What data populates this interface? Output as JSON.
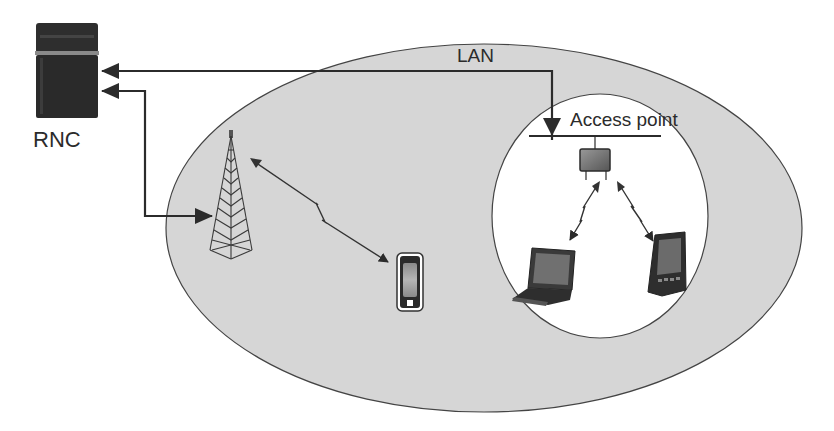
{
  "diagram": {
    "labels": {
      "rnc": "RNC",
      "lan": "LAN",
      "access_point": "Access point"
    },
    "nodes": [
      {
        "id": "rnc",
        "label": "RNC",
        "kind": "server"
      },
      {
        "id": "base-station",
        "label": "",
        "kind": "cell-tower"
      },
      {
        "id": "mobile-phone",
        "label": "",
        "kind": "phone"
      },
      {
        "id": "access-point",
        "label": "Access point",
        "kind": "wireless-access-point"
      },
      {
        "id": "laptop",
        "label": "",
        "kind": "laptop"
      },
      {
        "id": "pda",
        "label": "",
        "kind": "pda"
      }
    ],
    "regions": [
      {
        "id": "outer-coverage",
        "label": "",
        "fill": "#d6d6d6"
      },
      {
        "id": "wlan-coverage",
        "label": "",
        "fill": "#ffffff"
      }
    ],
    "edges": [
      {
        "from": "access-point",
        "to": "rnc",
        "label": "LAN",
        "type": "wired"
      },
      {
        "from": "base-station",
        "to": "rnc",
        "label": "",
        "type": "wired"
      },
      {
        "from": "base-station",
        "to": "mobile-phone",
        "label": "",
        "type": "wireless"
      },
      {
        "from": "access-point",
        "to": "laptop",
        "label": "",
        "type": "wireless"
      },
      {
        "from": "access-point",
        "to": "pda",
        "label": "",
        "type": "wireless"
      }
    ],
    "colors": {
      "ellipse_fill": "#d6d6d6",
      "line": "#2b2b2b",
      "device_dark": "#333333"
    }
  }
}
